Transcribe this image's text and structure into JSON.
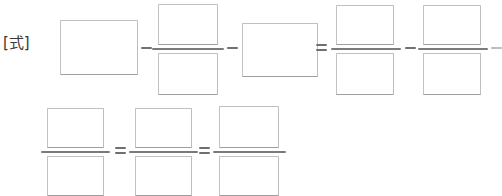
{
  "page": {
    "label": "[式]",
    "label_name": "equation-prompt-label",
    "width": 500,
    "height": 190,
    "background": "#ffffff",
    "box_border_color": "#b9b9b9",
    "rule_color": "#7b7b7b",
    "operator_color": "#6f6f6f"
  },
  "operators": {
    "minus": "−",
    "equals": "=",
    "minus_name": "minus-operator",
    "equals_name": "equals-operator"
  },
  "rows": [
    {
      "id": "row-1",
      "items": [
        {
          "kind": "label",
          "text": "[式]",
          "name": "equation-prompt-label",
          "x": 3,
          "y": 34,
          "w": 36,
          "h": 20
        },
        {
          "kind": "box",
          "text": "",
          "name": "answer-box-1",
          "x": 60,
          "y": 20,
          "w": 78,
          "h": 55
        },
        {
          "kind": "minus",
          "text": "−",
          "name": "minus-operator-1",
          "x": 141,
          "y": 47,
          "w": 11,
          "h": 2
        },
        {
          "kind": "box",
          "text": "",
          "name": "answer-box-2-numerator",
          "x": 158,
          "y": 4,
          "w": 60,
          "h": 41
        },
        {
          "kind": "fracbar",
          "text": "",
          "name": "fraction-bar-1",
          "x": 152,
          "y": 48,
          "w": 72,
          "h": 2
        },
        {
          "kind": "box",
          "text": "",
          "name": "answer-box-3-denominator",
          "x": 158,
          "y": 53,
          "w": 60,
          "h": 42
        },
        {
          "kind": "minus",
          "text": "−",
          "name": "minus-operator-2",
          "x": 227,
          "y": 47,
          "w": 11,
          "h": 2
        },
        {
          "kind": "box",
          "text": "",
          "name": "answer-box-4",
          "x": 242,
          "y": 23,
          "w": 76,
          "h": 54
        },
        {
          "kind": "equals",
          "text": "=",
          "name": "equals-operator-1",
          "x": 316,
          "y": 44,
          "w": 11,
          "h": 7
        },
        {
          "kind": "box",
          "text": "",
          "name": "answer-box-5-numerator",
          "x": 336,
          "y": 5,
          "w": 58,
          "h": 40
        },
        {
          "kind": "fracbar",
          "text": "",
          "name": "fraction-bar-2",
          "x": 331,
          "y": 48,
          "w": 70,
          "h": 2
        },
        {
          "kind": "box",
          "text": "",
          "name": "answer-box-6-denominator",
          "x": 336,
          "y": 53,
          "w": 58,
          "h": 42
        },
        {
          "kind": "minus",
          "text": "−",
          "name": "minus-operator-3",
          "x": 405,
          "y": 47,
          "w": 11,
          "h": 2
        },
        {
          "kind": "box",
          "text": "",
          "name": "answer-box-7-numerator",
          "x": 423,
          "y": 5,
          "w": 58,
          "h": 40
        },
        {
          "kind": "fracbar",
          "text": "",
          "name": "fraction-bar-3",
          "x": 418,
          "y": 48,
          "w": 70,
          "h": 2
        },
        {
          "kind": "box",
          "text": "",
          "name": "answer-box-8-denominator",
          "x": 423,
          "y": 53,
          "w": 58,
          "h": 42
        },
        {
          "kind": "minus-faint",
          "text": "−",
          "name": "minus-operator-4",
          "x": 491,
          "y": 47,
          "w": 11,
          "h": 2
        }
      ]
    },
    {
      "id": "row-2",
      "items": [
        {
          "kind": "box",
          "text": "",
          "name": "answer-box-9-numerator",
          "x": 47,
          "y": 108,
          "w": 57,
          "h": 40
        },
        {
          "kind": "fracbar",
          "text": "",
          "name": "fraction-bar-4",
          "x": 41,
          "y": 151,
          "w": 69,
          "h": 2
        },
        {
          "kind": "box",
          "text": "",
          "name": "answer-box-10-denominator",
          "x": 47,
          "y": 156,
          "w": 57,
          "h": 40
        },
        {
          "kind": "equals",
          "text": "=",
          "name": "equals-operator-2",
          "x": 115,
          "y": 147,
          "w": 11,
          "h": 7
        },
        {
          "kind": "box",
          "text": "",
          "name": "answer-box-11-numerator",
          "x": 135,
          "y": 108,
          "w": 57,
          "h": 40
        },
        {
          "kind": "fracbar",
          "text": "",
          "name": "fraction-bar-5",
          "x": 129,
          "y": 151,
          "w": 69,
          "h": 2
        },
        {
          "kind": "box",
          "text": "",
          "name": "answer-box-12-denominator",
          "x": 135,
          "y": 156,
          "w": 57,
          "h": 40
        },
        {
          "kind": "equals",
          "text": "=",
          "name": "equals-operator-3",
          "x": 199,
          "y": 147,
          "w": 11,
          "h": 7
        },
        {
          "kind": "box",
          "text": "",
          "name": "answer-box-13-numerator",
          "x": 219,
          "y": 106,
          "w": 60,
          "h": 42
        },
        {
          "kind": "fracbar",
          "text": "",
          "name": "fraction-bar-6",
          "x": 213,
          "y": 151,
          "w": 73,
          "h": 2
        },
        {
          "kind": "box",
          "text": "",
          "name": "answer-box-14-denominator",
          "x": 219,
          "y": 156,
          "w": 60,
          "h": 40
        }
      ]
    }
  ]
}
